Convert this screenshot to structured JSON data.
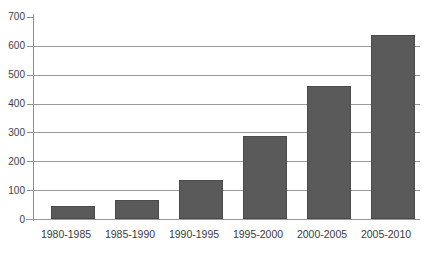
{
  "chart_data": {
    "type": "bar",
    "title": "",
    "xlabel": "",
    "ylabel": "",
    "categories": [
      "1980-1985",
      "1985-1990",
      "1990-1995",
      "1995-2000",
      "2000-2005",
      "2005-2010"
    ],
    "values": [
      45,
      65,
      135,
      285,
      460,
      635
    ],
    "ylim": [
      0,
      700
    ],
    "yticks": [
      0,
      100,
      200,
      300,
      400,
      500,
      600,
      700
    ],
    "ytick_labels": [
      "0",
      "100",
      "200",
      "300",
      "400",
      "500",
      "600",
      "700"
    ],
    "grid": true,
    "legend": false,
    "bar_color": "#5a5a5a",
    "gridline_color": "#9a9a9a",
    "axis_color": "#8f8f8f",
    "background_color": "#ffffff"
  }
}
